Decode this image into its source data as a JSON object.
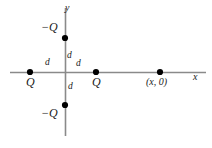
{
  "figure": {
    "background_color": "#ffffff",
    "axis_color": "#8a8a8a",
    "point_color": "#000000",
    "text_color": "#1a1a1a",
    "width": 212,
    "height": 148
  },
  "axes": {
    "x_label": "x",
    "y_label": "y",
    "x_axis": {
      "x1": 10,
      "y1": 72.5,
      "x2": 206,
      "y2": 72.5
    },
    "y_axis": {
      "x1": 65.5,
      "y1": 8,
      "x2": 65.5,
      "y2": 136
    }
  },
  "points": [
    {
      "name": "charge-left-positive",
      "label": "Q",
      "x": 30,
      "y": 72,
      "label_x": 26,
      "label_y": 76
    },
    {
      "name": "charge-right-positive",
      "label": "Q",
      "x": 96,
      "y": 72,
      "label_x": 92,
      "label_y": 76
    },
    {
      "name": "field-point",
      "label": "(x, 0)",
      "x": 160,
      "y": 72,
      "label_x": 146,
      "label_y": 77
    },
    {
      "name": "charge-top-negative",
      "label": "−Q",
      "x": 65,
      "y": 38,
      "label_x": 41,
      "label_y": 21
    },
    {
      "name": "charge-bottom-negative",
      "label": "−Q",
      "x": 65,
      "y": 105,
      "label_x": 41,
      "label_y": 107
    }
  ],
  "distance_labels": [
    {
      "name": "distance-left",
      "text": "d",
      "x": 45,
      "y": 58
    },
    {
      "name": "distance-up",
      "text": "d",
      "x": 67,
      "y": 51
    },
    {
      "name": "distance-right",
      "text": "d",
      "x": 76,
      "y": 59
    },
    {
      "name": "distance-down",
      "text": "d",
      "x": 68,
      "y": 82
    }
  ],
  "axis_label_positions": {
    "x": {
      "x": 193,
      "y": 72
    },
    "y": {
      "x": 65,
      "y": 3
    }
  },
  "chart_data": {
    "type": "scatter",
    "xlabel": "x",
    "ylabel": "y",
    "grid": false,
    "legend": false,
    "x": [
      -1,
      1,
      0,
      0,
      2.4
    ],
    "y": [
      0,
      0,
      1,
      -1,
      0
    ],
    "point_labels": [
      "Q",
      "Q",
      "-Q",
      "-Q",
      "(x, 0)"
    ],
    "annotations": [
      "d",
      "d",
      "d",
      "d"
    ],
    "xlim": [
      -1.7,
      2.9
    ],
    "ylim": [
      -1.95,
      1.95
    ]
  }
}
